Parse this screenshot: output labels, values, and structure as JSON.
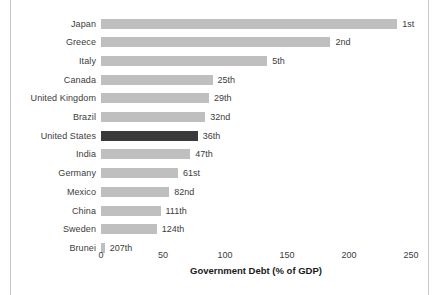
{
  "chart_data": {
    "type": "bar",
    "orientation": "horizontal",
    "title": "",
    "xlabel": "Government Debt (% of GDP)",
    "ylabel": "",
    "xlim": [
      0,
      250
    ],
    "xticks": [
      0,
      50,
      100,
      150,
      200,
      250
    ],
    "xtick_labels": [
      "0",
      "50",
      "100",
      "150",
      "200",
      "250"
    ],
    "grid": false,
    "legend": "none",
    "categories": [
      "Japan",
      "Greece",
      "Italy",
      "Canada",
      "United Kingdom",
      "Brazil",
      "United States",
      "India",
      "Germany",
      "Mexico",
      "China",
      "Sweden",
      "Brunei"
    ],
    "values": [
      239,
      185,
      134,
      90,
      87,
      84,
      78,
      72,
      62,
      55,
      48,
      45,
      3
    ],
    "annotations": [
      "1st",
      "2nd",
      "5th",
      "25th",
      "29th",
      "32nd",
      "36th",
      "47th",
      "61st",
      "82nd",
      "111th",
      "124th",
      "207th"
    ],
    "highlight_index": 6,
    "colors": {
      "bar": "#bfbfbf",
      "bar_highlight": "#3a3a3a",
      "text": "#3c3c3c",
      "frame": "#c8c8c8",
      "background": "#ffffff"
    }
  }
}
